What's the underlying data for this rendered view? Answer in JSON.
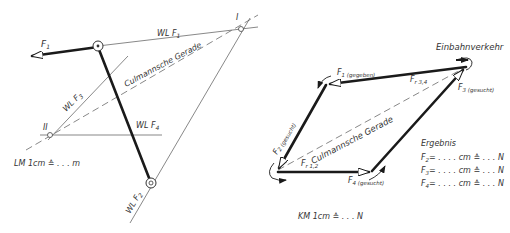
{
  "lageplan": {
    "labels": {
      "f1": "F",
      "f1_sub": "1",
      "wl_f1": "WL F",
      "wl_f1_sub": "1",
      "wl_f2": "WL F",
      "wl_f2_sub": "2",
      "wl_f3": "WL F",
      "wl_f3_sub": "3",
      "wl_f4": "WL F",
      "wl_f4_sub": "4",
      "culmann": "Culmannsche Gerade",
      "point_i": "I",
      "point_ii": "II",
      "scale": "LM 1cm ≙ . . . m"
    }
  },
  "kraefteplan": {
    "labels": {
      "f1": "F",
      "f1_sub": "1 (gegeben)",
      "f2": "F",
      "f2_sub": "2 (gesucht)",
      "f3": "F",
      "f3_sub": "3 (gesucht)",
      "f4": "F",
      "f4_sub": "4 (gesucht)",
      "fr34": "F",
      "fr34_sub": "r 3,4",
      "fr12": "F",
      "fr12_sub": "r 1,2",
      "culmann": "Culmannsche Gerade",
      "einbahn": "Einbahnverkehr",
      "scale": "KM 1cm ≙ . . . N"
    },
    "result": {
      "title": "Ergebnis",
      "rows": [
        {
          "force": "F",
          "sub": "2",
          "text": "= . . . . cm ≙ . . . N"
        },
        {
          "force": "F",
          "sub": "3",
          "text": "= . . . . cm ≙ . . . N"
        },
        {
          "force": "F",
          "sub": "4",
          "text": "= . . . . cm ≙ . . . N"
        }
      ]
    }
  }
}
